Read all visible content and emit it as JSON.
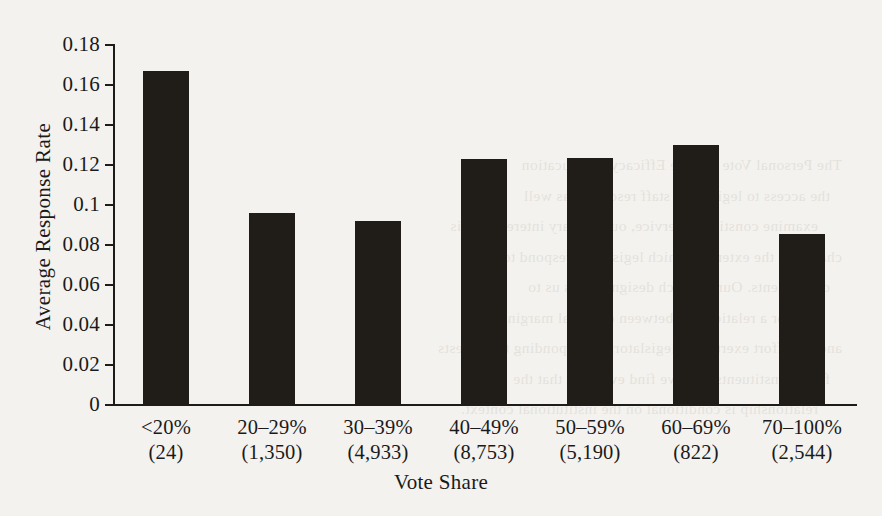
{
  "chart_data": {
    "type": "bar",
    "title": "",
    "xlabel": "Vote Share",
    "ylabel": "Average Response Rate",
    "categories": [
      "<20%",
      "20–29%",
      "30–39%",
      "40–49%",
      "50–59%",
      "60–69%",
      "70–100%"
    ],
    "category_counts": [
      "(24)",
      "(1,350)",
      "(4,933)",
      "(8,753)",
      "(5,190)",
      "(822)",
      "(2,544)"
    ],
    "values": [
      0.167,
      0.096,
      0.092,
      0.123,
      0.1235,
      0.13,
      0.0855
    ],
    "ylim": [
      0,
      0.18
    ],
    "ytick_labels": [
      "0.18",
      "0.16",
      "0.14",
      "0.12",
      "0.1",
      "0.08",
      "0.06",
      "0.04",
      "0.02",
      "0"
    ],
    "ytick_values": [
      0.18,
      0.16,
      0.14,
      0.12,
      0.1,
      0.08,
      0.06,
      0.04,
      0.02,
      0
    ],
    "grid": false,
    "legend": false,
    "bar_color": "#201d19",
    "axis_color": "#1f1c18",
    "background_color": "#f4f2ee"
  },
  "page_bleed": {
    "lines": [
      "The Personal Vote and the Efficacy of Education",
      "the   access   to   legislative   staff   resources   as   well",
      "examine constituent service, our primary interest in this",
      "chapter is the extent to which legislators respond to their",
      "constituents.   Our   research   design   allows   us   to",
      "test   for   a   relationship   between   electoral   margins",
      "and the effort exerted by legislators in responding to requests",
      "from constituents, and we find evidence that the",
      "relationship is conditional on the institutional context."
    ]
  }
}
